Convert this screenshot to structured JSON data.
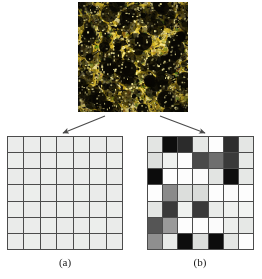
{
  "figure": {
    "source_image": {
      "name": "texture-micrograph",
      "description": "yellow and black speckled texture micrograph",
      "dominant_colors": [
        "#e8c93a",
        "#f2e06a",
        "#8a7a1f",
        "#141007",
        "#000000"
      ],
      "width_px": 110,
      "height_px": 110
    },
    "arrows": [
      {
        "name": "arrow-to-grid-a",
        "direction": "down-left"
      },
      {
        "name": "arrow-to-grid-b",
        "direction": "down-right"
      }
    ]
  },
  "grid_a": {
    "label": "(a)",
    "rows": 7,
    "cols": 7,
    "border_color": "#4c4c4c",
    "cells": [
      [
        "#ebeceb",
        "#ebeceb",
        "#eceeec",
        "#eaebea",
        "#eceeec",
        "#eaebea",
        "#ebeceb"
      ],
      [
        "#eceeec",
        "#eaebea",
        "#ebeceb",
        "#eceeec",
        "#eaebea",
        "#ebeceb",
        "#eceeec"
      ],
      [
        "#eaebea",
        "#ebeceb",
        "#eceeec",
        "#eaebea",
        "#ebeceb",
        "#eceeec",
        "#eaebea"
      ],
      [
        "#ebeceb",
        "#eceeec",
        "#eaebea",
        "#ebeceb",
        "#eceeec",
        "#eaebea",
        "#ebeceb"
      ],
      [
        "#eceeec",
        "#eaebea",
        "#ebeceb",
        "#eceeec",
        "#eaebea",
        "#ebeceb",
        "#eceeec"
      ],
      [
        "#eaebea",
        "#ebeceb",
        "#eceeec",
        "#eaebea",
        "#ebeceb",
        "#eceeec",
        "#eaebea"
      ],
      [
        "#ebeceb",
        "#eceeec",
        "#eaebea",
        "#ebeceb",
        "#eceeec",
        "#eaebea",
        "#ebeceb"
      ]
    ]
  },
  "grid_b": {
    "label": "(b)",
    "rows": 7,
    "cols": 7,
    "border_color": "#4c4c4c",
    "cells": [
      [
        "#e3e5e3",
        "#0d0d0d",
        "#2b2b2b",
        "#e6e8e6",
        "#fdfdfd",
        "#2e2e2e",
        "#e4e6e4"
      ],
      [
        "#dcdedc",
        "#eff1ef",
        "#fdfdfd",
        "#4a4a4a",
        "#6e6e6e",
        "#3a3a3a",
        "#e7e9e7"
      ],
      [
        "#0c0c0c",
        "#fdfdfd",
        "#fdfdfd",
        "#fbfbfb",
        "#e2e4e2",
        "#0d0d0d",
        "#e6e8e6"
      ],
      [
        "#fdfdfd",
        "#8a8a8a",
        "#dcdedc",
        "#d9dbd9",
        "#fdfdfd",
        "#fbfbfb",
        "#fdfdfd"
      ],
      [
        "#e4e6e4",
        "#3a3a3a",
        "#eff1ef",
        "#3a3a3a",
        "#e9ebe9",
        "#eff1ef",
        "#f2f4f2"
      ],
      [
        "#555555",
        "#9a9a9a",
        "#fdfdfd",
        "#fdfdfd",
        "#fbfbfb",
        "#eceeec",
        "#e6e8e6"
      ],
      [
        "#8f8f8f",
        "#e9ebe9",
        "#0d0d0d",
        "#dcdedc",
        "#0c0c0c",
        "#e4e6e4",
        "#fdfdfd"
      ]
    ]
  }
}
